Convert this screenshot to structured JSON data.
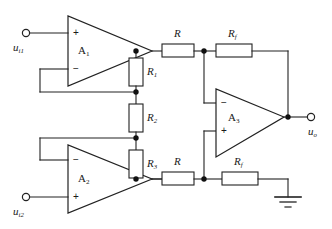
{
  "diagram": {
    "stroke_color": "#222222",
    "background_color": "#ffffff",
    "node_color": "#111111"
  },
  "amplifiers": [
    {
      "id": "A1",
      "label": "A",
      "subscript": "1",
      "top_sign": "+",
      "bottom_sign": "−"
    },
    {
      "id": "A2",
      "label": "A",
      "subscript": "2",
      "top_sign": "−",
      "bottom_sign": "+"
    },
    {
      "id": "A3",
      "label": "A",
      "subscript": "3",
      "top_sign": "−",
      "bottom_sign": "+"
    }
  ],
  "resistors": [
    {
      "id": "R1",
      "label": "R",
      "subscript": "1",
      "orientation": "vertical"
    },
    {
      "id": "R2",
      "label": "R",
      "subscript": "2",
      "orientation": "vertical"
    },
    {
      "id": "R3",
      "label": "R",
      "subscript": "3",
      "orientation": "vertical"
    },
    {
      "id": "R_top",
      "label": "R",
      "subscript": "",
      "orientation": "horizontal"
    },
    {
      "id": "Rf_top",
      "label": "R",
      "subscript": "f",
      "orientation": "horizontal"
    },
    {
      "id": "R_bottom",
      "label": "R",
      "subscript": "",
      "orientation": "horizontal"
    },
    {
      "id": "Rf_bottom",
      "label": "R",
      "subscript": "f",
      "orientation": "horizontal"
    }
  ],
  "terminals": [
    {
      "id": "ui1",
      "label": "u",
      "subscript": "i1",
      "kind": "input"
    },
    {
      "id": "ui2",
      "label": "u",
      "subscript": "i2",
      "kind": "input"
    },
    {
      "id": "uo",
      "label": "u",
      "subscript": "o",
      "kind": "output"
    }
  ],
  "ground": {
    "id": "gnd",
    "symbol": "earth-ground"
  }
}
